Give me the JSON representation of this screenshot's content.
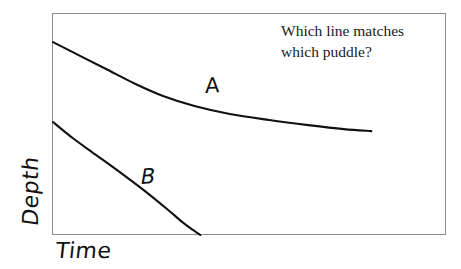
{
  "figure": {
    "background_color": "#ffffff",
    "frame_color": "#8e8e8e",
    "ink_color": "#111111"
  },
  "prompt": {
    "line1": "Which line matches",
    "line2": "which puddle?"
  },
  "axes": {
    "y_label": "Depth",
    "x_label": "Time"
  },
  "labels": {
    "curve_a": "A",
    "curve_b": "B"
  },
  "chart_data": {
    "type": "line",
    "title": "",
    "subtitle": "",
    "xlabel": "Time",
    "ylabel": "Depth",
    "xlim": [
      0,
      1
    ],
    "ylim": [
      0,
      1
    ],
    "grid": false,
    "axis_ticks": false,
    "tick_labels": [],
    "legend": "inline-annotations",
    "annotations": [
      {
        "text": "Which line matches which puddle?",
        "position": "top-right"
      },
      {
        "text": "A",
        "position": "above upper curve, x~0.41"
      },
      {
        "text": "B",
        "position": "above lower curve, x~0.24"
      }
    ],
    "series": [
      {
        "name": "A",
        "label": "A",
        "color": "#111111",
        "description": "Shallow, slowly evaporating puddle - gentle decay that flattens out and never reaches zero within the plotted time window.",
        "x": [
          0.0,
          0.07,
          0.14,
          0.21,
          0.28,
          0.36,
          0.45,
          0.55,
          0.65,
          0.74,
          0.81
        ],
        "y": [
          0.869,
          0.806,
          0.743,
          0.68,
          0.626,
          0.581,
          0.545,
          0.518,
          0.495,
          0.477,
          0.468
        ]
      },
      {
        "name": "B",
        "label": "B",
        "color": "#111111",
        "description": "Steeper decay reaching zero depth (the baseline) partway across the time axis.",
        "x": [
          0.0,
          0.05,
          0.11,
          0.17,
          0.23,
          0.29,
          0.33,
          0.36,
          0.375
        ],
        "y": [
          0.509,
          0.437,
          0.36,
          0.283,
          0.203,
          0.117,
          0.057,
          0.018,
          0.0
        ]
      }
    ]
  }
}
